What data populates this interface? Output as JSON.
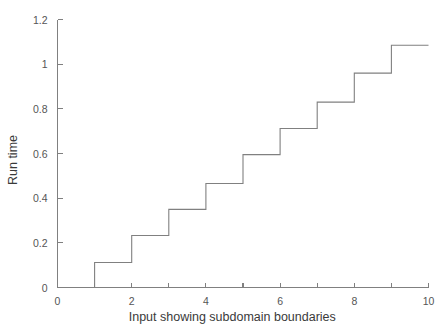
{
  "chart_data": {
    "type": "line",
    "subtype": "step",
    "title": "",
    "xlabel": "Input showing subdomain boundaries",
    "ylabel": "Run time",
    "xlim": [
      0,
      10
    ],
    "ylim": [
      0,
      1.2
    ],
    "grid": false,
    "legend": false,
    "line_color": "#808080",
    "background_color": "#ffffff",
    "axis_color": "#808080",
    "xticks": [
      0,
      1,
      2,
      3,
      4,
      5,
      6,
      7,
      8,
      9,
      10
    ],
    "xtick_labels": [
      "0",
      "",
      "2",
      "",
      "4",
      "",
      "6",
      "",
      "8",
      "",
      "10"
    ],
    "yticks": [
      0,
      0.2,
      0.4,
      0.6,
      0.8,
      1,
      1.2
    ],
    "ytick_labels": [
      "0",
      "0.2",
      "0.4",
      "0.6",
      "0.8",
      "1",
      "1.2"
    ],
    "steps": [
      {
        "x_start": 0,
        "x_end": 1,
        "y": 0
      },
      {
        "x_start": 1,
        "x_end": 2,
        "y": 0.112
      },
      {
        "x_start": 2,
        "x_end": 3,
        "y": 0.233
      },
      {
        "x_start": 3,
        "x_end": 4,
        "y": 0.35
      },
      {
        "x_start": 4,
        "x_end": 5,
        "y": 0.466
      },
      {
        "x_start": 5,
        "x_end": 6,
        "y": 0.595
      },
      {
        "x_start": 6,
        "x_end": 7,
        "y": 0.712
      },
      {
        "x_start": 7,
        "x_end": 8,
        "y": 0.83
      },
      {
        "x_start": 8,
        "x_end": 9,
        "y": 0.96
      },
      {
        "x_start": 9,
        "x_end": 10,
        "y": 1.085
      }
    ],
    "x": [
      0,
      1,
      2,
      3,
      4,
      5,
      6,
      7,
      8,
      9,
      10
    ],
    "values": [
      0,
      0.112,
      0.233,
      0.35,
      0.466,
      0.595,
      0.712,
      0.83,
      0.96,
      1.085,
      1.085
    ]
  }
}
